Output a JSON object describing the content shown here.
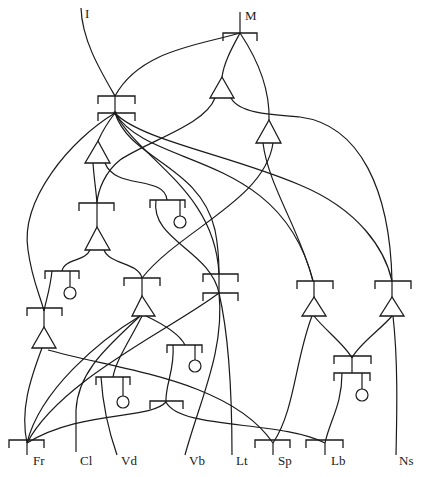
{
  "diagram": {
    "type": "network",
    "colors": {
      "line": "#1a1a1a",
      "background": "#ffffff"
    },
    "top_labels": {
      "I": "I",
      "M": "M"
    },
    "bottom_labels": {
      "Fr": "Fr",
      "Cl": "Cl",
      "Vd": "Vd",
      "Vb": "Vb",
      "Lt": "Lt",
      "Sp": "Sp",
      "Lb": "Lb",
      "Ns": "Ns"
    },
    "node_types": [
      "bracket",
      "double-bracket",
      "triangle",
      "bracket-with-circle"
    ],
    "inputs": [
      "I",
      "M"
    ],
    "outputs": [
      "Fr",
      "Cl",
      "Vd",
      "Vb",
      "Lt",
      "Sp",
      "Lb",
      "Ns"
    ]
  }
}
